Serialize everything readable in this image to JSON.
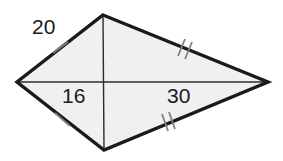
{
  "figure": {
    "name": "kite-quadrilateral",
    "shape_type": "kite",
    "fill_color": "#f0f0f0",
    "outline_color": "#1a1a1a",
    "diagonal_color": "#2b2b2b",
    "tick_color": "#808080",
    "background_color": "#ffffff",
    "vertices": {
      "top": {
        "x": 103,
        "y": 15
      },
      "right": {
        "x": 268,
        "y": 82
      },
      "bottom": {
        "x": 104,
        "y": 150
      },
      "left": {
        "x": 17,
        "y": 82
      }
    },
    "diagonals": [
      {
        "name": "horizontal-diagonal",
        "from": "left",
        "to": "right"
      },
      {
        "name": "vertical-diagonal",
        "from": "top",
        "to": "bottom"
      }
    ]
  },
  "labels": {
    "upper_left_side": "20",
    "left_diagonal_segment": "16",
    "right_diagonal_segment": "30"
  },
  "tick_marks": [
    {
      "name": "tick-upper-left",
      "side": "top-left",
      "count": 1,
      "x": 60,
      "y": 48
    },
    {
      "name": "tick-lower-left",
      "side": "bottom-left",
      "count": 1,
      "x": 62,
      "y": 120
    },
    {
      "name": "tick-upper-right",
      "side": "top-right",
      "count": 2,
      "x": 184,
      "y": 48
    },
    {
      "name": "tick-lower-right",
      "side": "bottom-right",
      "count": 2,
      "x": 168,
      "y": 123
    }
  ]
}
